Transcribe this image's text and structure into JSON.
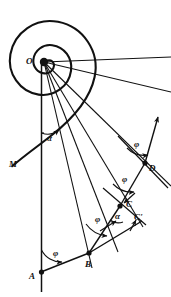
{
  "figure": {
    "kind": "geometry-diagram",
    "background_color": "#ffffff",
    "ink_color": "#111111",
    "width": 171,
    "height": 297
  },
  "points": [
    {
      "id": "O",
      "label": "O",
      "x": 44,
      "y": 62,
      "label_x": 26,
      "label_y": 57,
      "marker": "dot-large"
    },
    {
      "id": "M",
      "label": "M",
      "x": 12,
      "y": 166,
      "label_x": 9,
      "label_y": 160,
      "marker": "none"
    },
    {
      "id": "A",
      "label": "A",
      "x": 41,
      "y": 272,
      "label_x": 29,
      "label_y": 272,
      "marker": "dot"
    },
    {
      "id": "B",
      "label": "B",
      "x": 89,
      "y": 253,
      "label_x": 85,
      "label_y": 260,
      "marker": "dot"
    },
    {
      "id": "C",
      "label": "C",
      "x": 120,
      "y": 206,
      "label_x": 126,
      "label_y": 203,
      "marker": "dot"
    },
    {
      "id": "Cp",
      "label": "C'",
      "x": 134,
      "y": 214,
      "label_x": 133,
      "label_y": 215,
      "marker": "none"
    },
    {
      "id": "D",
      "label": "D",
      "x": 145,
      "y": 163,
      "label_x": 149,
      "label_y": 167,
      "marker": "dot"
    }
  ],
  "angle_labels": [
    {
      "id": "alpha-top",
      "text": "α",
      "x": 47,
      "y": 137
    },
    {
      "id": "phi-at-A",
      "text": "φ",
      "x": 53,
      "y": 252
    },
    {
      "id": "phi-at-B",
      "text": "φ",
      "x": 95,
      "y": 218
    },
    {
      "id": "alpha-at-C",
      "text": "α",
      "x": 117,
      "y": 214
    },
    {
      "id": "phi-at-C",
      "text": "φ",
      "x": 122,
      "y": 178
    },
    {
      "id": "phi-at-D",
      "text": "φ",
      "x": 134,
      "y": 143
    }
  ],
  "greek": {
    "alpha": "α",
    "phi": "φ"
  },
  "spiral": {
    "type": "logarithmic",
    "pole": {
      "x": 44,
      "y": 62
    },
    "description": "Logarithmic spiral winding outward counter-clockwise from pole O, tail ending at M on the left"
  },
  "rays": {
    "description": "Radial rays emanating from pole O toward the chain vertices and beyond the right edge",
    "count": 8
  },
  "chain": {
    "description": "Polygonal chain A-B-C-D inscribed to the spiral with constant turning angle",
    "vertices": [
      "A",
      "B",
      "C",
      "D"
    ]
  },
  "axis": {
    "description": "Vertical reference line through O and A extended to bottom of frame"
  }
}
